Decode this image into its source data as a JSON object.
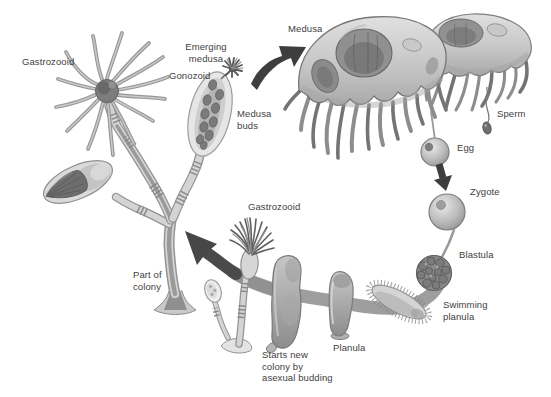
{
  "diagram": {
    "labels": {
      "gastrozooid_top": "Gastrozooid",
      "emerging_medusa": "Emerging\nmedusa",
      "gonozoid": "Gonozoid",
      "medusa_buds": "Medusa\nbuds",
      "medusa": "Medusa",
      "sperm": "Sperm",
      "egg": "Egg",
      "zygote": "Zygote",
      "blastula": "Blastula",
      "swimming_planula": "Swimming\nplanula",
      "planula": "Planula",
      "starts_new_colony": "Starts new\ncolony by\nasexual budding",
      "part_of_colony": "Part of\ncolony",
      "gastrozooid_bottom": "Gastrozooid"
    },
    "cycle_order": [
      "Medusa",
      "Egg",
      "Zygote",
      "Blastula",
      "Swimming planula",
      "Planula",
      "Starts new colony by asexual budding",
      "Part of colony",
      "Gastrozooid",
      "Gonozoid",
      "Medusa buds",
      "Emerging medusa"
    ],
    "colors": {
      "background": "#ffffff",
      "label_text": "#3e3e3e",
      "dark_arrow": "#3e3e3e",
      "cycle_band": "#9e9e9e",
      "figure_light": "#d6d6d6",
      "figure_mid": "#a9a9a9",
      "figure_dark": "#757575",
      "outline": "#7d7d7d"
    }
  }
}
